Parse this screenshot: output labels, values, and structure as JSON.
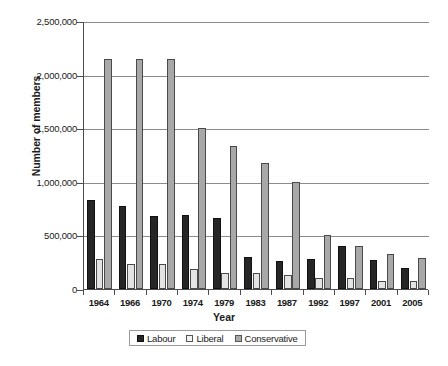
{
  "chart_data": {
    "type": "bar",
    "title": "",
    "xlabel": "Year",
    "ylabel": "Number of members",
    "categories": [
      "1964",
      "1966",
      "1970",
      "1974",
      "1979",
      "1983",
      "1987",
      "1992",
      "1997",
      "2001",
      "2005"
    ],
    "series": [
      {
        "name": "Labour",
        "color": "#262626",
        "values": [
          830000,
          775000,
          680000,
          690000,
          660000,
          295000,
          265000,
          280000,
          400000,
          275000,
          200000
        ]
      },
      {
        "name": "Liberal",
        "color": "#e3e3e3",
        "values": [
          280000,
          230000,
          235000,
          190000,
          145000,
          145000,
          135000,
          100000,
          100000,
          73000,
          73000
        ]
      },
      {
        "name": "Conservative",
        "color": "#a8a8a8",
        "values": [
          2150000,
          2150000,
          2150000,
          1500000,
          1330000,
          1180000,
          1000000,
          500000,
          400000,
          330000,
          290000
        ]
      }
    ],
    "ylim": [
      0,
      2500000
    ],
    "yticks": [
      0,
      500000,
      1000000,
      1500000,
      2000000,
      2500000
    ],
    "ytick_labels": [
      "0",
      "500,000",
      "1,000,000",
      "1,500,000",
      "2,000,000",
      "2,500,000"
    ],
    "grid": true,
    "legend_position": "bottom-center"
  },
  "legend": {
    "items": [
      {
        "label": "Labour"
      },
      {
        "label": "Liberal"
      },
      {
        "label": "Conservative"
      }
    ]
  },
  "caption": {
    "text": ""
  }
}
